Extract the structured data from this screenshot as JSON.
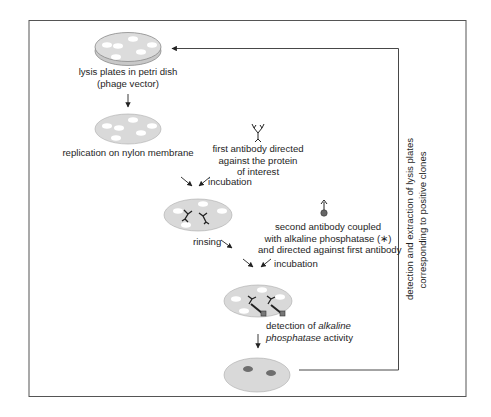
{
  "diagram": {
    "type": "flowchart",
    "topic": "immunological screening of phage expression library",
    "colors": {
      "frame": "#555555",
      "plate_fill": "#d9d9d9",
      "plate_rim": "#8a8a8a",
      "plaque": "#ffffff",
      "positive_spot": "#6e6e6e",
      "text": "#1e1e1e"
    },
    "steps": [
      {
        "id": "petri",
        "label_line1": "lysis plates in petri dish",
        "label_line2": "(phage vector)"
      },
      {
        "id": "membrane",
        "label": "replication on nylon membrane"
      },
      {
        "id": "first-antibody",
        "label_line1": "first antibody directed",
        "label_line2": "against the protein",
        "label_line3": "of interest"
      },
      {
        "id": "incubation-1",
        "label": "incubation"
      },
      {
        "id": "rinsing",
        "label": "rinsing"
      },
      {
        "id": "second-antibody",
        "label_line1": "second antibody coupled",
        "label_line2": "with alkaline phosphatase (∗)",
        "label_line3": "and directed against first antibody"
      },
      {
        "id": "incubation-2",
        "label": "incubation"
      },
      {
        "id": "detection",
        "label_line1_prefix": "detection of ",
        "label_line1_italic": "alkaline",
        "label_line2_italic": "phosphatase",
        "label_line2_suffix": " activity"
      }
    ],
    "feedback": {
      "label_line1": "detection and extraction of lysis plates",
      "label_line2": "corresponding to positive clones"
    }
  }
}
